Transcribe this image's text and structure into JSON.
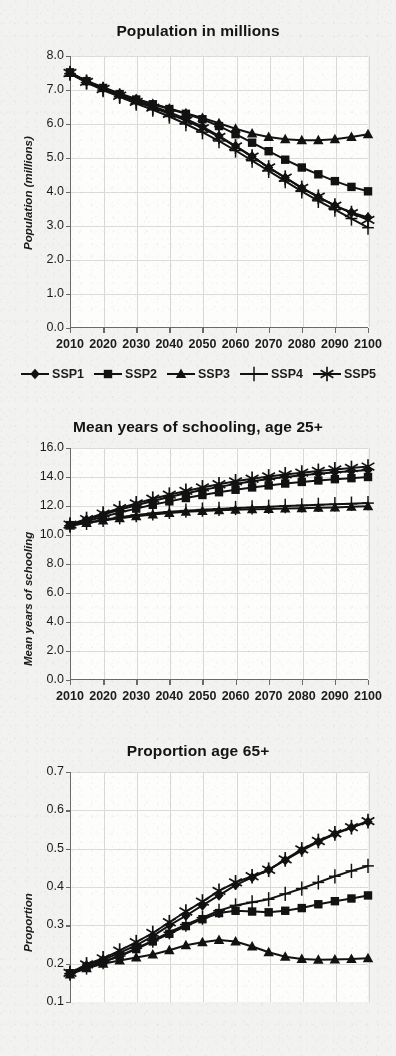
{
  "figure": {
    "background_color": "#f2f2f0",
    "ink_color": "#121212",
    "panel_count": 3
  },
  "legend": {
    "position": "below-panel-1",
    "items": [
      {
        "label": "SSP1",
        "marker": "diamond"
      },
      {
        "label": "SSP2",
        "marker": "square"
      },
      {
        "label": "SSP3",
        "marker": "triangle"
      },
      {
        "label": "SSP4",
        "marker": "plus"
      },
      {
        "label": "SSP5",
        "marker": "asterisk"
      }
    ]
  },
  "chart_data": [
    {
      "type": "line",
      "title": "Population in millions",
      "xlabel": "",
      "ylabel": "Population (millions)",
      "x": [
        2010,
        2015,
        2020,
        2025,
        2030,
        2035,
        2040,
        2045,
        2050,
        2055,
        2060,
        2065,
        2070,
        2075,
        2080,
        2085,
        2090,
        2095,
        2100
      ],
      "xlim": [
        2010,
        2100
      ],
      "ylim": [
        0.0,
        8.0
      ],
      "ytick_labels": [
        "0.0",
        "1.0",
        "2.0",
        "3.0",
        "4.0",
        "5.0",
        "6.0",
        "7.0",
        "8.0"
      ],
      "xtick_labels": [
        "2010",
        "2020",
        "2030",
        "2040",
        "2050",
        "2060",
        "2070",
        "2080",
        "2090",
        "2100"
      ],
      "grid": true,
      "legend_position": "below",
      "series": [
        {
          "name": "SSP1",
          "marker": "diamond",
          "values": [
            7.5,
            7.25,
            7.05,
            6.85,
            6.68,
            6.52,
            6.35,
            6.15,
            5.92,
            5.65,
            5.35,
            5.05,
            4.72,
            4.42,
            4.12,
            3.85,
            3.6,
            3.4,
            3.25
          ]
        },
        {
          "name": "SSP2",
          "marker": "square",
          "values": [
            7.52,
            7.26,
            7.06,
            6.88,
            6.72,
            6.58,
            6.44,
            6.3,
            6.14,
            5.94,
            5.7,
            5.45,
            5.2,
            4.95,
            4.72,
            4.52,
            4.32,
            4.15,
            4.02
          ]
        },
        {
          "name": "SSP3",
          "marker": "triangle",
          "values": [
            7.5,
            7.27,
            7.08,
            6.9,
            6.74,
            6.6,
            6.46,
            6.32,
            6.18,
            6.02,
            5.86,
            5.72,
            5.62,
            5.55,
            5.52,
            5.52,
            5.55,
            5.62,
            5.7
          ]
        },
        {
          "name": "SSP4",
          "marker": "plus",
          "values": [
            7.48,
            7.22,
            7.0,
            6.8,
            6.6,
            6.42,
            6.22,
            6.0,
            5.76,
            5.5,
            5.22,
            4.92,
            4.62,
            4.32,
            4.02,
            3.74,
            3.48,
            3.22,
            2.95
          ]
        },
        {
          "name": "SSP5",
          "marker": "asterisk",
          "values": [
            7.5,
            7.24,
            7.03,
            6.83,
            6.65,
            6.48,
            6.3,
            6.1,
            5.88,
            5.62,
            5.34,
            5.04,
            4.72,
            4.42,
            4.12,
            3.86,
            3.6,
            3.38,
            3.18
          ]
        }
      ]
    },
    {
      "type": "line",
      "title": "Mean years of schooling, age 25+",
      "xlabel": "",
      "ylabel": "Mean years of schooling",
      "x": [
        2010,
        2015,
        2020,
        2025,
        2030,
        2035,
        2040,
        2045,
        2050,
        2055,
        2060,
        2065,
        2070,
        2075,
        2080,
        2085,
        2090,
        2095,
        2100
      ],
      "xlim": [
        2010,
        2100
      ],
      "ylim": [
        0.0,
        16.0
      ],
      "ytick_labels": [
        "0.0",
        "2.0",
        "4.0",
        "6.0",
        "8.0",
        "10.0",
        "12.0",
        "14.0",
        "16.0"
      ],
      "xtick_labels": [
        "2010",
        "2020",
        "2030",
        "2040",
        "2050",
        "2060",
        "2070",
        "2080",
        "2090",
        "2100"
      ],
      "grid": true,
      "series": [
        {
          "name": "SSP1",
          "marker": "diamond",
          "values": [
            10.7,
            11.05,
            11.4,
            11.75,
            12.05,
            12.35,
            12.62,
            12.88,
            13.1,
            13.32,
            13.52,
            13.7,
            13.86,
            14.0,
            14.12,
            14.22,
            14.32,
            14.4,
            14.48
          ]
        },
        {
          "name": "SSP2",
          "marker": "square",
          "values": [
            10.68,
            10.95,
            11.25,
            11.55,
            11.82,
            12.08,
            12.32,
            12.55,
            12.76,
            12.95,
            13.12,
            13.28,
            13.42,
            13.55,
            13.66,
            13.76,
            13.85,
            13.92,
            14.0
          ]
        },
        {
          "name": "SSP3",
          "marker": "triangle",
          "values": [
            10.66,
            10.82,
            11.0,
            11.15,
            11.3,
            11.42,
            11.52,
            11.6,
            11.66,
            11.7,
            11.74,
            11.78,
            11.8,
            11.82,
            11.85,
            11.88,
            11.9,
            11.94,
            11.98
          ]
        },
        {
          "name": "SSP4",
          "marker": "plus",
          "values": [
            10.64,
            10.84,
            11.04,
            11.22,
            11.38,
            11.5,
            11.6,
            11.68,
            11.75,
            11.8,
            11.86,
            11.9,
            11.95,
            12.0,
            12.04,
            12.08,
            12.12,
            12.16,
            12.2
          ]
        },
        {
          "name": "SSP5",
          "marker": "asterisk",
          "values": [
            10.72,
            11.1,
            11.48,
            11.85,
            12.18,
            12.5,
            12.78,
            13.04,
            13.28,
            13.5,
            13.7,
            13.88,
            14.04,
            14.18,
            14.3,
            14.42,
            14.52,
            14.62,
            14.72
          ]
        }
      ]
    },
    {
      "type": "line",
      "title": "Proportion age 65+",
      "xlabel": "",
      "ylabel": "Proportion",
      "x": [
        2010,
        2015,
        2020,
        2025,
        2030,
        2035,
        2040,
        2045,
        2050,
        2055,
        2060,
        2065,
        2070,
        2075,
        2080,
        2085,
        2090,
        2095,
        2100
      ],
      "xlim": [
        2010,
        2100
      ],
      "ylim": [
        0.1,
        0.7
      ],
      "ytick_labels": [
        "0.1",
        "0.2",
        "0.3",
        "0.4",
        "0.5",
        "0.6",
        "0.7"
      ],
      "xtick_labels": [
        "2010",
        "2020",
        "2030",
        "2040",
        "2050",
        "2060",
        "2070",
        "2080",
        "2090",
        "2100"
      ],
      "grid": true,
      "note": "bottom of panel is cropped by the page edge",
      "series": [
        {
          "name": "SSP1",
          "marker": "diamond",
          "values": [
            0.175,
            0.195,
            0.21,
            0.228,
            0.248,
            0.272,
            0.3,
            0.325,
            0.352,
            0.378,
            0.405,
            0.425,
            0.445,
            0.47,
            0.495,
            0.518,
            0.538,
            0.555,
            0.57
          ]
        },
        {
          "name": "SSP2",
          "marker": "square",
          "values": [
            0.175,
            0.192,
            0.205,
            0.22,
            0.238,
            0.258,
            0.278,
            0.298,
            0.316,
            0.332,
            0.338,
            0.336,
            0.334,
            0.338,
            0.345,
            0.355,
            0.363,
            0.37,
            0.378
          ]
        },
        {
          "name": "SSP3",
          "marker": "triangle",
          "values": [
            0.172,
            0.188,
            0.2,
            0.208,
            0.216,
            0.224,
            0.235,
            0.248,
            0.256,
            0.262,
            0.258,
            0.245,
            0.23,
            0.218,
            0.212,
            0.21,
            0.211,
            0.212,
            0.214
          ]
        },
        {
          "name": "SSP4",
          "marker": "plus",
          "values": [
            0.174,
            0.19,
            0.204,
            0.22,
            0.24,
            0.26,
            0.282,
            0.302,
            0.32,
            0.338,
            0.352,
            0.36,
            0.368,
            0.382,
            0.396,
            0.412,
            0.428,
            0.442,
            0.455
          ]
        },
        {
          "name": "SSP5",
          "marker": "asterisk",
          "values": [
            0.176,
            0.198,
            0.214,
            0.234,
            0.256,
            0.28,
            0.308,
            0.336,
            0.362,
            0.39,
            0.412,
            0.428,
            0.445,
            0.472,
            0.498,
            0.52,
            0.54,
            0.556,
            0.572
          ]
        }
      ]
    }
  ]
}
